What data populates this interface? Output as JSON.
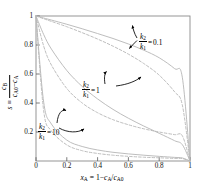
{
  "chart_data": {
    "type": "line",
    "title": "",
    "xlabel": "x_A = 1 - c_A/c_A0",
    "ylabel": "s = c_B/(c_A0 - c_A)",
    "xlim": [
      0,
      1
    ],
    "ylim": [
      0,
      1
    ],
    "grid": false,
    "legend_position": "inline-annotations",
    "xticks": [
      "0",
      "0.2",
      "0.4",
      "0.6",
      "0.8",
      "1"
    ],
    "xtick_values": [
      0,
      0.2,
      0.4,
      0.6,
      0.8,
      1
    ],
    "yticks": [
      "0.2",
      "0.4",
      "0.6",
      "0.8",
      "1"
    ],
    "ytick_values": [
      0.2,
      0.4,
      0.6,
      0.8,
      1
    ],
    "line_color": "#b9b9b9",
    "axis_color": "#6e6e6e",
    "annotation_color": "#000000",
    "series": [
      {
        "name": "k2/k1 = 0.1 (batch / plug flow, solid)",
        "style": "solid",
        "ratio": 0.1,
        "x": [
          0,
          0.05,
          0.1,
          0.2,
          0.3,
          0.4,
          0.5,
          0.6,
          0.7,
          0.8,
          0.9,
          0.95,
          1
        ],
        "y": [
          1,
          0.986,
          0.972,
          0.943,
          0.912,
          0.879,
          0.845,
          0.807,
          0.764,
          0.712,
          0.637,
          0.578,
          0
        ]
      },
      {
        "name": "k2/k1 = 0.1 (CSTR, dashed)",
        "style": "dashed",
        "ratio": 0.1,
        "x": [
          0,
          0.05,
          0.1,
          0.2,
          0.3,
          0.4,
          0.5,
          0.6,
          0.7,
          0.8,
          0.9,
          0.95,
          1
        ],
        "y": [
          1,
          0.981,
          0.963,
          0.926,
          0.885,
          0.841,
          0.792,
          0.737,
          0.672,
          0.592,
          0.477,
          0.387,
          0
        ]
      },
      {
        "name": "k2/k1 = 1 (batch / plug flow, solid)",
        "style": "solid",
        "ratio": 1,
        "x": [
          0,
          0.05,
          0.1,
          0.2,
          0.3,
          0.4,
          0.5,
          0.6,
          0.7,
          0.8,
          0.9,
          0.95,
          1
        ],
        "y": [
          1,
          0.872,
          0.772,
          0.624,
          0.514,
          0.428,
          0.356,
          0.295,
          0.241,
          0.191,
          0.14,
          0.113,
          0
        ]
      },
      {
        "name": "k2/k1 = 1 (CSTR, dashed)",
        "style": "dashed",
        "ratio": 1,
        "x": [
          0,
          0.05,
          0.1,
          0.2,
          0.3,
          0.4,
          0.5,
          0.6,
          0.7,
          0.8,
          0.9,
          0.95,
          1
        ],
        "y": [
          1,
          0.792,
          0.662,
          0.5,
          0.4,
          0.333,
          0.285,
          0.25,
          0.222,
          0.2,
          0.182,
          0.174,
          0
        ]
      },
      {
        "name": "k2/k1 = 10 (batch / plug flow, solid)",
        "style": "solid",
        "ratio": 10,
        "x": [
          0,
          0.05,
          0.1,
          0.2,
          0.3,
          0.4,
          0.5,
          0.6,
          0.7,
          0.8,
          0.9,
          0.95,
          1
        ],
        "y": [
          1,
          0.405,
          0.255,
          0.144,
          0.1,
          0.076,
          0.06,
          0.049,
          0.04,
          0.032,
          0.025,
          0.021,
          0
        ]
      },
      {
        "name": "k2/k1 = 10 (CSTR, dashed)",
        "style": "dashed",
        "ratio": 10,
        "x": [
          0,
          0.05,
          0.1,
          0.2,
          0.3,
          0.4,
          0.5,
          0.6,
          0.7,
          0.8,
          0.9,
          0.95,
          1
        ],
        "y": [
          1,
          0.345,
          0.208,
          0.111,
          0.071,
          0.052,
          0.04,
          0.032,
          0.026,
          0.022,
          0.018,
          0.017,
          0
        ]
      }
    ],
    "annotations": [
      {
        "id": "ann-01",
        "text": "k2/k1 = 0.1",
        "value": "0.1"
      },
      {
        "id": "ann-1",
        "text": "k2/k1 = 1",
        "value": "1"
      },
      {
        "id": "ann-10",
        "text": "k2/k1 = 10",
        "value": "10"
      }
    ]
  },
  "axes": {
    "x_ticks": [
      "0",
      "0.2",
      "0.4",
      "0.6",
      "0.8",
      "1"
    ],
    "y_ticks": [
      "1",
      "0.8",
      "0.6",
      "0.4",
      "0.2"
    ],
    "x_label": {
      "var": "x",
      "var_sub": "A",
      "eq": "=",
      "one": "1",
      "minus": "−",
      "num": "c",
      "num_sub": "A",
      "slash": "/",
      "den": "c",
      "den_sub": "A0"
    },
    "y_label": {
      "s": "s",
      "equiv": "≡",
      "num": "c",
      "num_sub": "B",
      "den_a": "c",
      "den_a_sub": "A0",
      "minus": "−",
      "den_b": "c",
      "den_b_sub": "A"
    }
  },
  "annotations": {
    "k_sym": "k",
    "sub2": "2",
    "sub1": "1",
    "eq": "=",
    "val_01": "0.1",
    "val_1": "1",
    "val_10": "10"
  }
}
